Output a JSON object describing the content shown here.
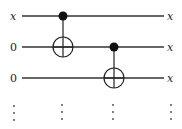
{
  "diagram": {
    "type": "quantum-circuit",
    "wires": [
      {
        "input_label": "x",
        "output_label": "x"
      },
      {
        "input_label": "0",
        "output_label": "x"
      },
      {
        "input_label": "0",
        "output_label": "x"
      }
    ],
    "gates": [
      {
        "type": "CNOT",
        "control_wire": 0,
        "target_wire": 1
      },
      {
        "type": "CNOT",
        "control_wire": 1,
        "target_wire": 2
      }
    ],
    "ellipsis": "⋮"
  }
}
